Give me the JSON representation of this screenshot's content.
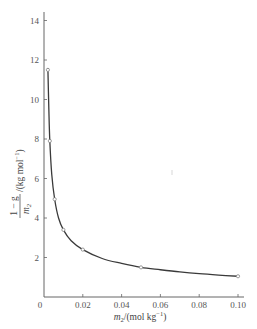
{
  "chart_data": {
    "type": "line",
    "title": "",
    "xlabel": "m2/(mol kg^-1)",
    "ylabel": "(1 - g)/m2 /(kg mol^-1)",
    "xlabel_parts": {
      "var": "m",
      "sub": "2",
      "unit": "/(mol kg",
      "sup": "−1",
      "close": ")"
    },
    "ylabel_parts": {
      "numerator": "1 − g",
      "denominator_var": "m",
      "denominator_sub": "2",
      "unit": "/(kg mol",
      "sup": "−1",
      "close": ")"
    },
    "xlim": [
      0,
      0.1
    ],
    "ylim": [
      0,
      14.5
    ],
    "xticks": [
      0,
      0.02,
      0.04,
      0.06,
      0.08,
      0.1
    ],
    "xtick_labels": [
      "0",
      "0.02",
      "0.04",
      "0.06",
      "0.08",
      "0.10"
    ],
    "yticks": [
      2,
      4,
      6,
      8,
      10,
      12,
      14
    ],
    "ytick_labels": [
      "2",
      "4",
      "6",
      "8",
      "10",
      "12",
      "14"
    ],
    "grid": false,
    "legend": null,
    "series": [
      {
        "name": "measured",
        "style": "points",
        "x": [
          0.002,
          0.003,
          0.0055,
          0.01,
          0.02,
          0.05,
          0.1
        ],
        "y": [
          11.5,
          7.9,
          4.95,
          3.4,
          2.4,
          1.5,
          1.05
        ]
      },
      {
        "name": "fitted curve",
        "style": "smooth-line",
        "x": [
          0.002,
          0.0025,
          0.003,
          0.004,
          0.0055,
          0.0075,
          0.01,
          0.014,
          0.02,
          0.03,
          0.04,
          0.05,
          0.06,
          0.07,
          0.08,
          0.09,
          0.1
        ],
        "y": [
          11.6,
          9.5,
          7.9,
          6.2,
          4.95,
          4.0,
          3.4,
          2.85,
          2.4,
          1.95,
          1.7,
          1.5,
          1.38,
          1.27,
          1.18,
          1.11,
          1.05
        ]
      }
    ],
    "annotations": []
  },
  "layout": {
    "origin_px": [
      44,
      297
    ],
    "x_px_per_unit": 1940,
    "y_px_per_unit": 19.75,
    "x_axis_end_px": 244,
    "y_axis_top_px": 12,
    "line_color": "#3a3a3a",
    "axis_color": "#666666"
  }
}
